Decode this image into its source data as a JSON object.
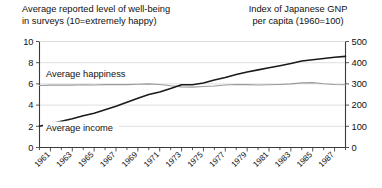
{
  "titles": {
    "left": "Average reported level of well-being\nin surveys (10=extremely happy)",
    "right": "Index of Japanese GNP\nper capita (1960=100)"
  },
  "chart_data": {
    "type": "line",
    "title": "Average reported level of well-being in surveys (10=extremely happy)",
    "title_right": "Index of Japanese GNP per capita (1960=100)",
    "xlabel": "",
    "ylabel": "",
    "grid": true,
    "legend": "inline-labels",
    "xlim": [
      1960,
      1988
    ],
    "x": [
      1960,
      1961,
      1962,
      1963,
      1964,
      1965,
      1966,
      1967,
      1968,
      1969,
      1970,
      1971,
      1972,
      1973,
      1974,
      1975,
      1976,
      1977,
      1978,
      1979,
      1980,
      1981,
      1982,
      1983,
      1984,
      1985,
      1986,
      1987,
      1988
    ],
    "xticks": [
      1961,
      1963,
      1965,
      1967,
      1969,
      1971,
      1973,
      1975,
      1977,
      1979,
      1981,
      1983,
      1985,
      1987
    ],
    "xticklabels": [
      "1961",
      "1963",
      "1965",
      "1967",
      "1969",
      "1971",
      "1973",
      "1975",
      "1977",
      "1979",
      "1981",
      "1983",
      "1985",
      "1987"
    ],
    "axes": [
      {
        "id": "left",
        "name": "Average happiness (0-10 scale)",
        "ylim": [
          0,
          10
        ],
        "yticks": [
          0,
          2,
          4,
          6,
          8,
          10
        ],
        "yticklabels": [
          "0",
          "2",
          "4",
          "6",
          "8",
          "10"
        ]
      },
      {
        "id": "right",
        "name": "Index of Japanese GNP per capita (1960=100)",
        "ylim": [
          0,
          500
        ],
        "yticks": [
          0,
          100,
          200,
          300,
          400,
          500
        ],
        "yticklabels": [
          "0",
          "100",
          "200",
          "300",
          "400",
          "500"
        ]
      }
    ],
    "series": [
      {
        "name": "Average happiness",
        "label": "Average happiness",
        "axis": "left",
        "color": "#9a9a9a",
        "values": [
          5.85,
          5.88,
          5.9,
          5.88,
          5.92,
          5.9,
          5.93,
          5.95,
          5.93,
          5.96,
          6.0,
          5.95,
          5.82,
          5.72,
          5.7,
          5.75,
          5.8,
          5.9,
          5.95,
          5.93,
          5.9,
          5.92,
          5.95,
          6.0,
          6.1,
          6.12,
          6.02,
          5.95,
          5.92
        ]
      },
      {
        "name": "Average income",
        "label": "Average income",
        "axis": "right",
        "color": "#1a1a1a",
        "values": [
          100,
          112,
          124,
          136,
          150,
          162,
          178,
          195,
          214,
          232,
          250,
          262,
          278,
          296,
          296,
          304,
          318,
          330,
          344,
          356,
          366,
          376,
          386,
          396,
          408,
          414,
          420,
          426,
          430
        ]
      }
    ]
  }
}
